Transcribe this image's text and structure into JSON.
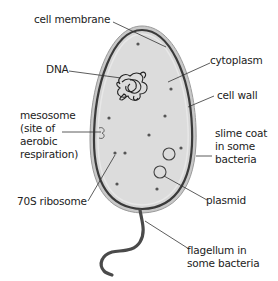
{
  "diagram": {
    "labels": {
      "cell_membrane": "cell membrane",
      "dna": "DNA",
      "cytoplasm": "cytoplasm",
      "cell_wall": "cell wall",
      "mesosome_line1": "mesosome",
      "mesosome_line2": "(site of",
      "mesosome_line3": "aerobic",
      "mesosome_line4": "respiration)",
      "slime_line1": "slime coat",
      "slime_line2": "in some",
      "slime_line3": "bacteria",
      "ribosome": "70S ribosome",
      "plasmid": "plasmid",
      "flagellum_line1": "flagellum in",
      "flagellum_line2": "some bacteria"
    },
    "colors": {
      "cytoplasm_fill": "#dcdcdc",
      "slime_coat": "#bdbdbd",
      "cell_wall": "#3a3a3a",
      "ribosome_dot": "#555555",
      "leader_line": "#333333"
    }
  }
}
